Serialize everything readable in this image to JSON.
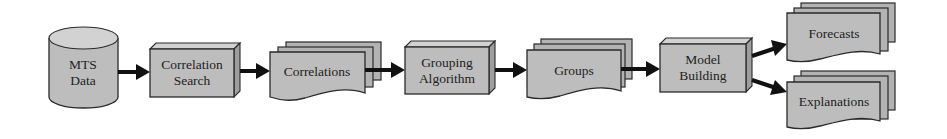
{
  "diagram": {
    "type": "flowchart",
    "direction": "left-to-right",
    "colors": {
      "shape_fill": "#bdbdbd",
      "outline": "#2a2a2a",
      "arrow": "#111111",
      "background": "#ffffff"
    },
    "nodes": {
      "mts_data": {
        "shape": "cylinder",
        "line1": "MTS",
        "line2": "Data"
      },
      "correlation_search": {
        "shape": "3d-box",
        "line1": "Correlation",
        "line2": "Search"
      },
      "correlations": {
        "shape": "multi-document",
        "label": "Correlations"
      },
      "grouping_algorithm": {
        "shape": "3d-box",
        "line1": "Grouping",
        "line2": "Algorithm"
      },
      "groups": {
        "shape": "multi-document",
        "label": "Groups"
      },
      "model_building": {
        "shape": "3d-box",
        "line1": "Model",
        "line2": "Building"
      },
      "forecasts": {
        "shape": "multi-document",
        "label": "Forecasts"
      },
      "explanations": {
        "shape": "multi-document",
        "label": "Explanations"
      }
    },
    "edges": [
      {
        "from": "MTS Data",
        "to": "Correlation Search"
      },
      {
        "from": "Correlation Search",
        "to": "Correlations"
      },
      {
        "from": "Correlations",
        "to": "Grouping Algorithm"
      },
      {
        "from": "Grouping Algorithm",
        "to": "Groups"
      },
      {
        "from": "Groups",
        "to": "Model Building"
      },
      {
        "from": "Model Building",
        "to": "Forecasts"
      },
      {
        "from": "Model Building",
        "to": "Explanations"
      }
    ]
  }
}
